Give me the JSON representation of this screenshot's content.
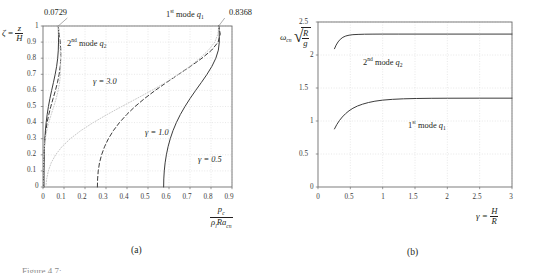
{
  "figure": {
    "panel_a_caption": "(a)",
    "panel_b_caption": "(b)",
    "partial_caption": "Figure 4.7:"
  },
  "chart_data": [
    {
      "id": "panel-a",
      "type": "line",
      "title": "",
      "xlabel": "p_c / (rho_l Ra_cn)",
      "ylabel": "zeta = z / H",
      "xlim": [
        0,
        0.9
      ],
      "ylim": [
        0,
        1
      ],
      "xticks": [
        "0",
        "0.1",
        "0.2",
        "0.3",
        "0.4",
        "0.5",
        "0.6",
        "0.7",
        "0.8",
        "0.9"
      ],
      "yticks": [
        "0",
        "0.1",
        "0.2",
        "0.3",
        "0.4",
        "0.5",
        "0.6",
        "0.7",
        "0.8",
        "0.9",
        "1"
      ],
      "grid": true,
      "legend_position": "inline-annotations",
      "annotations": [
        {
          "text": "0.0729",
          "x": 0.0729,
          "y": 1.0,
          "role": "second-mode-endpoint"
        },
        {
          "text": "0.8368",
          "x": 0.8368,
          "y": 1.0,
          "role": "first-mode-endpoint"
        },
        {
          "text": "1st mode q1",
          "role": "group-label-first-mode"
        },
        {
          "text": "2nd mode q2",
          "role": "group-label-second-mode"
        },
        {
          "text": "gamma = 3.0",
          "role": "curve-label"
        },
        {
          "text": "gamma = 1.0",
          "role": "curve-label"
        },
        {
          "text": "gamma = 0.5",
          "role": "curve-label"
        }
      ],
      "series": [
        {
          "name": "1st mode q1, gamma = 0.5",
          "style": "solid",
          "points": [
            [
              0.5745,
              0
            ],
            [
              0.5752,
              0.05
            ],
            [
              0.5775,
              0.1
            ],
            [
              0.5815,
              0.15
            ],
            [
              0.5875,
              0.2
            ],
            [
              0.5955,
              0.25
            ],
            [
              0.606,
              0.3
            ],
            [
              0.619,
              0.35
            ],
            [
              0.635,
              0.4
            ],
            [
              0.654,
              0.45
            ],
            [
              0.676,
              0.5
            ],
            [
              0.7005,
              0.55
            ],
            [
              0.727,
              0.6
            ],
            [
              0.7545,
              0.65
            ],
            [
              0.781,
              0.7
            ],
            [
              0.8045,
              0.75
            ],
            [
              0.823,
              0.8
            ],
            [
              0.835,
              0.85
            ],
            [
              0.8395,
              0.9
            ],
            [
              0.839,
              0.95
            ],
            [
              0.8368,
              1.0
            ]
          ]
        },
        {
          "name": "1st mode q1, gamma = 1.0",
          "style": "dashed",
          "points": [
            [
              0.259,
              0
            ],
            [
              0.26,
              0.05
            ],
            [
              0.263,
              0.1
            ],
            [
              0.269,
              0.15
            ],
            [
              0.279,
              0.2
            ],
            [
              0.293,
              0.25
            ],
            [
              0.3115,
              0.3
            ],
            [
              0.335,
              0.35
            ],
            [
              0.364,
              0.4
            ],
            [
              0.3985,
              0.45
            ],
            [
              0.4385,
              0.5
            ],
            [
              0.484,
              0.55
            ],
            [
              0.5345,
              0.6
            ],
            [
              0.589,
              0.65
            ],
            [
              0.646,
              0.7
            ],
            [
              0.703,
              0.75
            ],
            [
              0.757,
              0.8
            ],
            [
              0.803,
              0.85
            ],
            [
              0.834,
              0.9
            ],
            [
              0.844,
              0.95
            ],
            [
              0.8368,
              1.0
            ]
          ]
        },
        {
          "name": "1st mode q1, gamma = 3.0",
          "style": "dotted",
          "points": [
            [
              0.0135,
              0
            ],
            [
              0.0175,
              0.05
            ],
            [
              0.0255,
              0.1
            ],
            [
              0.039,
              0.15
            ],
            [
              0.06,
              0.2
            ],
            [
              0.09,
              0.25
            ],
            [
              0.13,
              0.3
            ],
            [
              0.18,
              0.35
            ],
            [
              0.239,
              0.4
            ],
            [
              0.305,
              0.45
            ],
            [
              0.375,
              0.5
            ],
            [
              0.447,
              0.55
            ],
            [
              0.518,
              0.6
            ],
            [
              0.585,
              0.65
            ],
            [
              0.646,
              0.7
            ],
            [
              0.7,
              0.75
            ],
            [
              0.747,
              0.8
            ],
            [
              0.788,
              0.85
            ],
            [
              0.818,
              0.9
            ],
            [
              0.833,
              0.95
            ],
            [
              0.8368,
              1.0
            ]
          ]
        },
        {
          "name": "2nd mode q2, gamma = 0.5",
          "style": "solid",
          "points": [
            [
              0.0048,
              0
            ],
            [
              0.0049,
              0.05
            ],
            [
              0.0051,
              0.1
            ],
            [
              0.0055,
              0.15
            ],
            [
              0.0062,
              0.2
            ],
            [
              0.0073,
              0.25
            ],
            [
              0.009,
              0.3
            ],
            [
              0.0115,
              0.35
            ],
            [
              0.015,
              0.4
            ],
            [
              0.0198,
              0.45
            ],
            [
              0.0258,
              0.5
            ],
            [
              0.033,
              0.55
            ],
            [
              0.0412,
              0.6
            ],
            [
              0.0498,
              0.65
            ],
            [
              0.058,
              0.7
            ],
            [
              0.065,
              0.75
            ],
            [
              0.07,
              0.8
            ],
            [
              0.0728,
              0.85
            ],
            [
              0.0738,
              0.9
            ],
            [
              0.0736,
              0.95
            ],
            [
              0.0729,
              1.0
            ]
          ]
        },
        {
          "name": "2nd mode q2, gamma = 1.0",
          "style": "dashed",
          "points": [
            [
              0.0022,
              0
            ],
            [
              0.0023,
              0.05
            ],
            [
              0.0026,
              0.1
            ],
            [
              0.0032,
              0.15
            ],
            [
              0.0043,
              0.2
            ],
            [
              0.0062,
              0.25
            ],
            [
              0.0092,
              0.3
            ],
            [
              0.0135,
              0.35
            ],
            [
              0.0196,
              0.4
            ],
            [
              0.0275,
              0.45
            ],
            [
              0.0372,
              0.5
            ],
            [
              0.0482,
              0.55
            ],
            [
              0.0592,
              0.6
            ],
            [
              0.069,
              0.65
            ],
            [
              0.0768,
              0.7
            ],
            [
              0.082,
              0.75
            ],
            [
              0.0845,
              0.8
            ],
            [
              0.0848,
              0.85
            ],
            [
              0.082,
              0.9
            ],
            [
              0.077,
              0.95
            ],
            [
              0.0729,
              1.0
            ]
          ]
        },
        {
          "name": "2nd mode q2, gamma = 3.0",
          "style": "dotted",
          "points": [
            [
              0.0006,
              0
            ],
            [
              0.0008,
              0.05
            ],
            [
              0.0012,
              0.1
            ],
            [
              0.002,
              0.15
            ],
            [
              0.0036,
              0.2
            ],
            [
              0.0064,
              0.25
            ],
            [
              0.011,
              0.3
            ],
            [
              0.018,
              0.35
            ],
            [
              0.0275,
              0.4
            ],
            [
              0.039,
              0.45
            ],
            [
              0.0512,
              0.5
            ],
            [
              0.0628,
              0.55
            ],
            [
              0.0722,
              0.6
            ],
            [
              0.079,
              0.65
            ],
            [
              0.0828,
              0.7
            ],
            [
              0.0842,
              0.75
            ],
            [
              0.0838,
              0.8
            ],
            [
              0.082,
              0.85
            ],
            [
              0.0792,
              0.9
            ],
            [
              0.076,
              0.95
            ],
            [
              0.0729,
              1.0
            ]
          ]
        }
      ]
    },
    {
      "id": "panel-b",
      "type": "line",
      "title": "",
      "xlabel": "gamma = H / R",
      "ylabel": "omega_cn sqrt(R/g)",
      "xlim": [
        0,
        3
      ],
      "ylim": [
        0,
        2.5
      ],
      "xticks": [
        "0",
        "0.5",
        "1",
        "1.5",
        "2",
        "2.5",
        "3"
      ],
      "yticks": [
        "0",
        "0.5",
        "1",
        "1.5",
        "2",
        "2.5"
      ],
      "grid": true,
      "legend_position": "inline-annotations",
      "annotations": [
        {
          "text": "2nd mode q2",
          "role": "curve-label"
        },
        {
          "text": "1st mode q1",
          "role": "curve-label"
        }
      ],
      "series": [
        {
          "name": "2nd mode q2",
          "style": "solid",
          "points": [
            [
              0.255,
              2.095
            ],
            [
              0.28,
              2.15
            ],
            [
              0.31,
              2.198
            ],
            [
              0.345,
              2.238
            ],
            [
              0.385,
              2.268
            ],
            [
              0.43,
              2.288
            ],
            [
              0.48,
              2.3
            ],
            [
              0.54,
              2.308
            ],
            [
              0.62,
              2.312
            ],
            [
              0.72,
              2.315
            ],
            [
              0.85,
              2.316
            ],
            [
              1.0,
              2.317
            ],
            [
              1.25,
              2.317
            ],
            [
              1.5,
              2.317
            ],
            [
              2.0,
              2.317
            ],
            [
              2.5,
              2.317
            ],
            [
              3.0,
              2.317
            ]
          ]
        },
        {
          "name": "1st mode q1",
          "style": "solid",
          "points": [
            [
              0.255,
              0.88
            ],
            [
              0.29,
              0.945
            ],
            [
              0.33,
              1.005
            ],
            [
              0.375,
              1.06
            ],
            [
              0.425,
              1.11
            ],
            [
              0.48,
              1.155
            ],
            [
              0.54,
              1.193
            ],
            [
              0.61,
              1.227
            ],
            [
              0.69,
              1.255
            ],
            [
              0.78,
              1.28
            ],
            [
              0.88,
              1.3
            ],
            [
              1.0,
              1.316
            ],
            [
              1.15,
              1.328
            ],
            [
              1.32,
              1.336
            ],
            [
              1.52,
              1.341
            ],
            [
              1.75,
              1.344
            ],
            [
              2.0,
              1.345
            ],
            [
              2.5,
              1.346
            ],
            [
              3.0,
              1.346
            ]
          ]
        }
      ]
    }
  ],
  "panel_a": {
    "ylabel_zeta": "ζ",
    "ylabel_eq": "=",
    "ylabel_num": "z",
    "ylabel_den": "H",
    "xlabel_num": "p",
    "xlabel_num_sub": "c",
    "xlabel_den_rho": "ρ",
    "xlabel_den_rho_sub": "l",
    "xlabel_den_rest": "Ra",
    "xlabel_den_sub": "cn",
    "label_top_left": "0.0729",
    "label_top_right": "0.8368",
    "label_first_mode_pre": "1",
    "label_first_mode_sup": "st",
    "label_first_mode_post": " mode ",
    "label_first_mode_q": "q",
    "label_first_mode_qsub": "1",
    "label_second_mode_pre": "2",
    "label_second_mode_sup": "nd",
    "label_second_mode_post": " mode ",
    "label_second_mode_q": "q",
    "label_second_mode_qsub": "2",
    "gamma_3": "γ = 3.0",
    "gamma_1": "γ = 1.0",
    "gamma_05": "γ = 0.5",
    "xticks": [
      "0",
      "0.1",
      "0.2",
      "0.3",
      "0.4",
      "0.5",
      "0.6",
      "0.7",
      "0.8",
      "0.9"
    ],
    "yticks": [
      "1",
      "0.9",
      "0.8",
      "0.7",
      "0.6",
      "0.5",
      "0.4",
      "0.3",
      "0.2",
      "0.1",
      "0"
    ],
    "caption": "(a)"
  },
  "panel_b": {
    "ylabel_omega": "ω",
    "ylabel_omega_sub": "cn",
    "ylabel_num": "R",
    "ylabel_den": "g",
    "xlabel_gamma": "γ =",
    "xlabel_num": "H",
    "xlabel_den": "R",
    "label_second_mode_pre": "2",
    "label_second_mode_sup": "nd",
    "label_second_mode_post": " mode ",
    "label_second_mode_q": "q",
    "label_second_mode_qsub": "2",
    "label_first_mode_pre": "1",
    "label_first_mode_sup": "st",
    "label_first_mode_post": " mode ",
    "label_first_mode_q": "q",
    "label_first_mode_qsub": "1",
    "xticks": [
      "0",
      "0.5",
      "1",
      "1.5",
      "2",
      "2.5",
      "3"
    ],
    "yticks": [
      "2.5",
      "2",
      "1.5",
      "1",
      "0.5",
      "0"
    ],
    "caption": "(b)"
  },
  "colors": {
    "axis": "#6f6f6f",
    "grid": "#d9d9d9",
    "curve_dark": "#3c3c3c",
    "curve_light": "#c9c9c9",
    "text": "#231f20"
  }
}
